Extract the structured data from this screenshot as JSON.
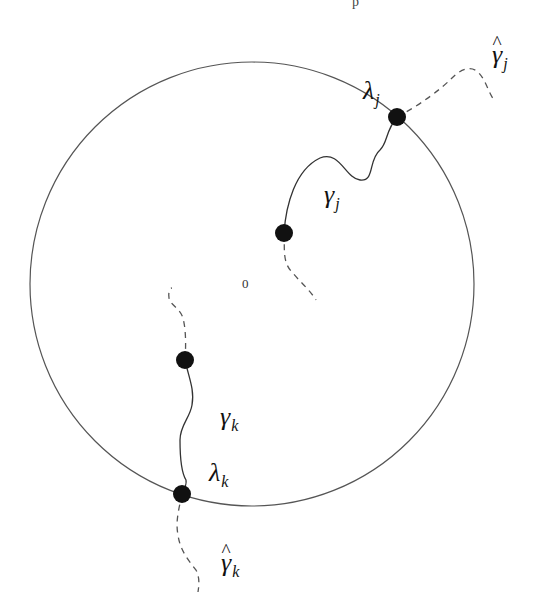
{
  "header_fragment": "p",
  "diagram": {
    "type": "unit-disk-curves",
    "circle": {
      "cx": 252,
      "cy": 284,
      "r": 222,
      "stroke": "#555555"
    },
    "origin_label": "0",
    "points": [
      {
        "id": "lambda_j",
        "x": 397,
        "y": 117,
        "r": 9
      },
      {
        "id": "gamma_j_start",
        "x": 284,
        "y": 233,
        "r": 9
      },
      {
        "id": "gamma_k_start",
        "x": 185,
        "y": 360,
        "r": 9
      },
      {
        "id": "lambda_k",
        "x": 182,
        "y": 494,
        "r": 9
      }
    ],
    "labels": {
      "lambda_j": {
        "base": "λ",
        "sub": "j"
      },
      "gamma_j": {
        "base": "γ",
        "sub": "j"
      },
      "gamma_hat_j": {
        "base": "γ",
        "sub": "j",
        "hat": "^"
      },
      "lambda_k": {
        "base": "λ",
        "sub": "k"
      },
      "gamma_k": {
        "base": "γ",
        "sub": "k"
      },
      "gamma_hat_k": {
        "base": "γ",
        "sub": "k",
        "hat": "^"
      }
    },
    "curves": {
      "gamma_j_solid": "M284,233 C286,205 295,170 320,158 C340,150 345,178 360,180 C375,182 368,160 380,150 C388,142 385,132 397,117",
      "gamma_j_dashed_out": "M397,117 C420,105 440,90 452,78 C460,70 470,65 478,72 C486,80 488,92 494,100",
      "gamma_j_dashed_in": "M284,233 C285,248 282,262 292,272 C300,282 310,290 316,300",
      "gamma_k_solid": "M185,360 C188,375 195,390 192,405 C190,418 180,425 180,440 C180,458 181,472 186,480 C187,485 184,490 182,494",
      "gamma_k_dashed_in": "M185,360 C186,345 186,330 183,318 C180,308 170,305 169,298 C168,292 170,288 172,288",
      "gamma_k_dashed_out": "M182,494 C180,505 175,520 178,535 C180,550 188,560 196,570 C200,578 199,585 198,592"
    },
    "stroke_color": "#333333",
    "dash_color": "#555555",
    "dot_color": "#111111"
  }
}
